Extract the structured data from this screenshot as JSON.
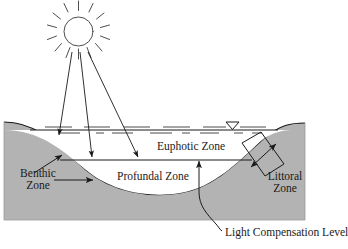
{
  "diagram": {
    "colors": {
      "substrate_fill": "#b3b3b3",
      "substrate_stroke": "#1a1a1a",
      "water_fill": "#ffffff",
      "line": "#1a1a1a",
      "text": "#1a1a1a",
      "sun_stroke": "#4d4d4d"
    },
    "labels": {
      "euphotic_zone": "Euphotic Zone",
      "profundal_zone": "Profundal Zone",
      "benthic_zone_line1": "Benthic",
      "benthic_zone_line2": "Zone",
      "littoral_zone_line1": "Littoral",
      "littoral_zone_line2": "Zone",
      "light_compensation_level": "Light Compensation Level"
    },
    "icons": {
      "sun": "sun-icon",
      "water_surface_marker": "water-level-triangle-icon",
      "sunlight_rays": "sunlight-arrow-icon",
      "benthic_leader": "leader-arrow-icon",
      "littoral_extent": "double-headed-arrow-icon",
      "lcl_pointer": "up-arrow-icon",
      "lcl_leader": "curved-leader-line-icon"
    },
    "geometry": {
      "water_surface_y": 130,
      "light_compensation_level_y": 160,
      "substrate_bottom_y": 220,
      "substrate_left_x": 4,
      "substrate_right_x": 305
    }
  }
}
